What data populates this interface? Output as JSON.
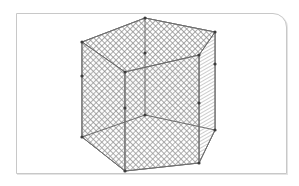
{
  "figure": {
    "frame": {
      "border_color": "#c8c8c8",
      "corner": "rounded-top-right"
    },
    "colors": {
      "mesh": "#8a8a8a",
      "edge": "#6e6e6e",
      "vertex": "#3c3c3c",
      "background": "#ffffff"
    },
    "vertices": {
      "top": [
        [
          82,
          42
        ],
        [
          145,
          18
        ],
        [
          215,
          32
        ],
        [
          199,
          55
        ],
        [
          125,
          72
        ]
      ],
      "middle": [
        [
          82,
          76
        ],
        [
          145,
          53
        ],
        [
          215,
          64
        ],
        [
          199,
          103
        ],
        [
          125,
          108
        ]
      ],
      "bottom": [
        [
          82,
          137
        ],
        [
          145,
          115
        ],
        [
          215,
          130
        ],
        [
          199,
          163
        ],
        [
          125,
          171
        ]
      ]
    }
  }
}
